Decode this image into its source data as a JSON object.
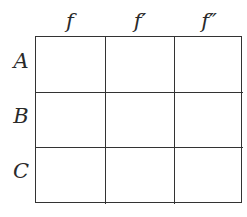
{
  "columns": [
    {
      "label": "f"
    },
    {
      "label": "f′"
    },
    {
      "label": "f″"
    }
  ],
  "rows": [
    {
      "label": "A"
    },
    {
      "label": "B"
    },
    {
      "label": "C"
    }
  ],
  "cells": [
    [
      "",
      "",
      ""
    ],
    [
      "",
      "",
      ""
    ],
    [
      "",
      "",
      ""
    ]
  ]
}
